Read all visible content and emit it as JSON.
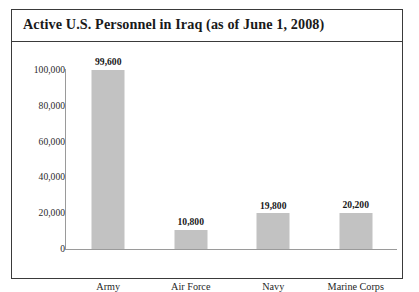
{
  "figure": {
    "title": "Active U.S. Personnel in Iraq (as of June 1, 2008)",
    "border_color": "#3a3a3a",
    "background_color": "#ffffff"
  },
  "chart_data": {
    "type": "bar",
    "title": "Active U.S. Personnel in Iraq (as of June 1, 2008)",
    "xlabel": "",
    "ylabel": "",
    "categories": [
      "Army",
      "Air Force",
      "Navy",
      "Marine Corps"
    ],
    "values": [
      99600,
      19800,
      10800,
      20200
    ],
    "series": [
      {
        "name": "Active U.S. Personnel",
        "values": [
          99600,
          10800,
          19800,
          20200
        ]
      }
    ],
    "data_labels": [
      "99,600",
      "10,800",
      "19,800",
      "20,200"
    ],
    "ylim": [
      0,
      100000
    ],
    "yticks": [
      0,
      20000,
      40000,
      60000,
      80000,
      100000
    ],
    "ytick_labels": [
      "0",
      "20,000",
      "40,000",
      "60,000",
      "80,000",
      "100,000"
    ],
    "grid": false,
    "legend": false,
    "bar_color": "#c2c2c2",
    "axis_color": "#9a9a9a"
  },
  "bars": [
    {
      "category": "Army",
      "value": 99600,
      "label": "99,600"
    },
    {
      "category": "Air Force",
      "value": 10800,
      "label": "10,800"
    },
    {
      "category": "Navy",
      "value": 19800,
      "label": "19,800"
    },
    {
      "category": "Marine Corps",
      "value": 20200,
      "label": "20,200"
    }
  ],
  "y_axis": {
    "ticks": [
      "100,000",
      "80,000",
      "60,000",
      "40,000",
      "20,000",
      "0"
    ]
  }
}
